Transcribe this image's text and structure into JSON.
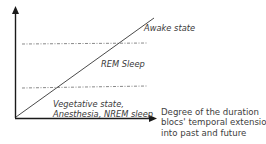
{
  "diagram": {
    "title": "",
    "x_axis": {
      "label_lines": [
        "Degree of the duration",
        "blocs' temporal extension",
        "into past and future"
      ]
    },
    "y_axis": {
      "label": ""
    },
    "regions": {
      "top": "Awake state",
      "middle": "REM Sleep",
      "bottom_lines": [
        "Vegetative state,",
        "Anesthesia, NREM sleep"
      ]
    },
    "threshold_lines": [
      {
        "name": "upper-threshold",
        "y": 44,
        "style": "dash-dot"
      },
      {
        "name": "lower-threshold",
        "y": 88,
        "style": "dash-dot"
      }
    ],
    "colors": {
      "axis": "#1a1a1a",
      "diagonal": "#4a4a4a",
      "threshold": "#6a6a6a",
      "text": "#3a3a3a"
    }
  }
}
